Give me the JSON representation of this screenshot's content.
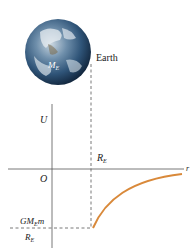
{
  "diagram": {
    "earth": {
      "label": "Earth",
      "mass_symbol": "M",
      "mass_subscript": "E"
    },
    "axes": {
      "y_label": "U",
      "x_label": "r",
      "origin_label": "O"
    },
    "radius_marker": {
      "symbol": "R",
      "subscript": "E"
    },
    "min_value": {
      "numerator": {
        "prefix": "GM",
        "subscript": "E",
        "suffix": "m"
      },
      "denominator": {
        "symbol": "R",
        "subscript": "E"
      },
      "sign": "−"
    },
    "curve_color": "#d9893a",
    "axis_color": "#555555"
  }
}
